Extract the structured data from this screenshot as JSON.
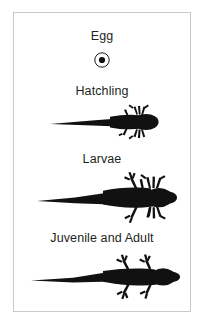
{
  "figure": {
    "border_color": "#c9c9c9",
    "background_color": "#ffffff",
    "silhouette_color": "#111111",
    "text_color": "#231f20"
  },
  "stages": [
    {
      "id": "egg",
      "label": "Egg",
      "icon": "egg-circle-icon",
      "description": "Small circle outline with a solid dot in the centre"
    },
    {
      "id": "hatchling",
      "label": "Hatchling",
      "icon": "hatchling-silhouette-icon",
      "description": "Black silhouette with long thin tail, rounded body, feathery gills and tiny forelimbs"
    },
    {
      "id": "larvae",
      "label": "Larvae",
      "icon": "larvae-silhouette-icon",
      "description": "Black silhouette with broad tail, four developed limbs with toes and external gills"
    },
    {
      "id": "adult",
      "label": "Juvenile and Adult",
      "icon": "adult-silhouette-icon",
      "description": "Black silhouette with tapering tail, four limbs with splayed toes, no external gills"
    }
  ]
}
